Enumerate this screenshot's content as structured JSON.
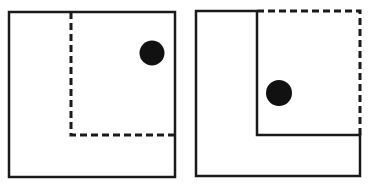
{
  "diagram": {
    "colors": {
      "stroke": "#1a1a1a",
      "dot": "#111111",
      "background": "#ffffff"
    },
    "panels": [
      {
        "id": "left",
        "outer_square": {
          "x": 9,
          "y": 12,
          "w": 166,
          "h": 165
        },
        "dashed_boundary": "inner quarter square (top-right), dashed",
        "dot": {
          "cx": 152,
          "cy": 53,
          "r": 12.5
        }
      },
      {
        "id": "right",
        "outer_square": {
          "x": 196,
          "y": 11,
          "w": 164,
          "h": 165
        },
        "dashed_boundary": "outer top-right edges of quarter square, dashed; inner L boundary solid",
        "dot": {
          "cx": 279,
          "cy": 93,
          "r": 13
        }
      }
    ]
  }
}
